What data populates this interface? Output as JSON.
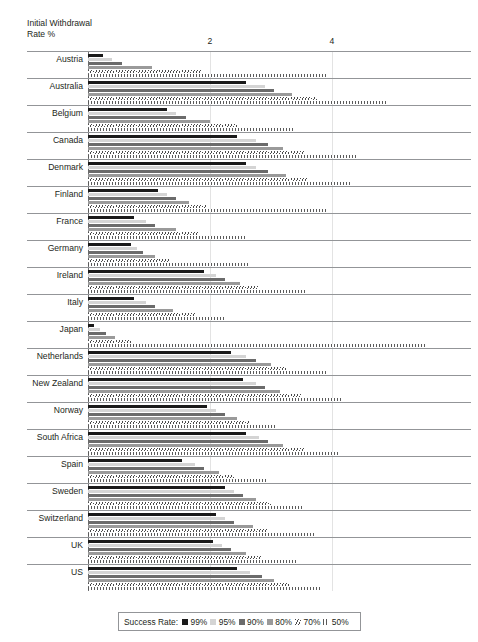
{
  "chart_data": {
    "type": "bar",
    "orientation": "horizontal",
    "title": "",
    "xlabel": "Initial Withdrawal Rate %",
    "ylabel": "",
    "xlim": [
      0,
      6.3
    ],
    "xticks": [
      2,
      4
    ],
    "xtick_labels": [
      "2",
      "4"
    ],
    "grid": "vertical gridlines at x=2 and x=4",
    "legend_position": "bottom-center",
    "legend_title": "Success Rate:",
    "categories": [
      "Austria",
      "Australia",
      "Belgium",
      "Canada",
      "Denmark",
      "Finland",
      "France",
      "Germany",
      "Ireland",
      "Italy",
      "Japan",
      "Netherlands",
      "New Zealand",
      "Norway",
      "South Africa",
      "Spain",
      "Sweden",
      "Switzerland",
      "UK",
      "US"
    ],
    "series": [
      {
        "name": "99%",
        "color": "#1a1a1a",
        "fill": "solid-black",
        "values": [
          0.25,
          2.6,
          1.3,
          2.45,
          2.6,
          1.15,
          0.75,
          0.7,
          1.9,
          0.75,
          0.1,
          2.35,
          2.55,
          1.95,
          2.6,
          1.55,
          2.25,
          2.1,
          2.05,
          2.45
        ]
      },
      {
        "name": "95%",
        "color": "#d4d4d4",
        "fill": "light-gray",
        "values": [
          0.4,
          2.9,
          1.45,
          2.75,
          2.75,
          1.3,
          0.95,
          0.8,
          2.1,
          0.95,
          0.2,
          2.6,
          2.75,
          2.1,
          2.8,
          1.75,
          2.4,
          2.25,
          2.2,
          2.65
        ]
      },
      {
        "name": "90%",
        "color": "#6b6b6b",
        "fill": "dark-gray",
        "values": [
          0.55,
          3.05,
          1.6,
          2.95,
          2.95,
          1.45,
          1.1,
          0.9,
          2.25,
          1.1,
          0.3,
          2.75,
          2.9,
          2.25,
          2.95,
          1.9,
          2.55,
          2.4,
          2.35,
          2.85
        ]
      },
      {
        "name": "80%",
        "color": "#9a9a9a",
        "fill": "medium-gray",
        "values": [
          1.05,
          3.35,
          2.0,
          3.2,
          3.25,
          1.65,
          1.45,
          1.1,
          2.5,
          1.4,
          0.45,
          3.0,
          3.15,
          2.45,
          3.2,
          2.15,
          2.75,
          2.7,
          2.6,
          3.05
        ]
      },
      {
        "name": "70%",
        "color": "#4a4a4a",
        "fill": "hatched",
        "values": [
          1.85,
          3.75,
          2.45,
          3.55,
          3.6,
          1.95,
          1.8,
          1.35,
          2.8,
          1.75,
          0.7,
          3.25,
          3.5,
          2.65,
          3.55,
          2.4,
          3.0,
          2.95,
          2.85,
          3.3
        ]
      },
      {
        "name": "50%",
        "color": "#5a5a5a",
        "fill": "dotted",
        "values": [
          3.9,
          4.9,
          3.4,
          4.4,
          4.3,
          3.9,
          2.6,
          2.65,
          3.6,
          2.25,
          5.55,
          3.9,
          4.15,
          3.1,
          4.1,
          2.95,
          3.55,
          3.7,
          3.45,
          3.8
        ]
      }
    ]
  },
  "axis": {
    "title_text": "Initial Withdrawal\nRate %"
  },
  "legend": {
    "title": "Success Rate:",
    "items": [
      {
        "label": "99%"
      },
      {
        "label": "95%"
      },
      {
        "label": "90%"
      },
      {
        "label": "80%"
      },
      {
        "label": "70%"
      },
      {
        "label": "50%"
      }
    ]
  }
}
